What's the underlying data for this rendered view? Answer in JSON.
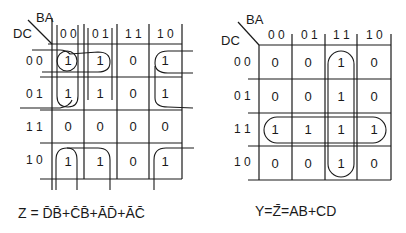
{
  "maps": [
    {
      "id": "left",
      "row_var": "DC",
      "col_var": "BA",
      "col_labels": [
        "0 0",
        "0 1",
        "1 1",
        "1 0"
      ],
      "row_labels": [
        "0 0",
        "0 1",
        "1 1",
        "1 0"
      ],
      "cells": [
        [
          "1",
          "1",
          "0",
          "1"
        ],
        [
          "1",
          "1",
          "0",
          "1"
        ],
        [
          "0",
          "0",
          "0",
          "0"
        ],
        [
          "1",
          "1",
          "0",
          "1"
        ]
      ],
      "groups": [
        "DB",
        "CB",
        "AD",
        "AC"
      ],
      "equation": "Z = D̄B̄+C̄B̄+ĀD̄+ĀC̄"
    },
    {
      "id": "right",
      "row_var": "DC",
      "col_var": "BA",
      "col_labels": [
        "0 0",
        "0 1",
        "1 1",
        "1 0"
      ],
      "row_labels": [
        "0 0",
        "0 1",
        "1 1",
        "1 0"
      ],
      "cells": [
        [
          "0",
          "0",
          "1",
          "0"
        ],
        [
          "0",
          "0",
          "1",
          "0"
        ],
        [
          "1",
          "1",
          "1",
          "1"
        ],
        [
          "0",
          "0",
          "1",
          "0"
        ]
      ],
      "groups": [
        "AB",
        "CD"
      ],
      "equation": "Y=Z̄=AB+CD"
    }
  ]
}
